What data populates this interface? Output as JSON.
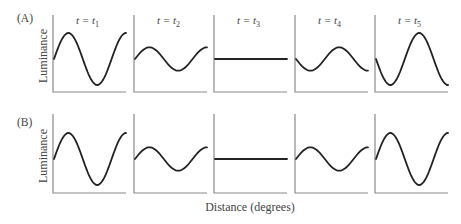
{
  "figure": {
    "rows": [
      {
        "label": "(A)",
        "ylabel": "Luminance"
      },
      {
        "label": "(B)",
        "ylabel": "Luminance"
      }
    ],
    "time_labels": [
      {
        "t": "t = ",
        "sub": "1"
      },
      {
        "t": "t = ",
        "sub": "2"
      },
      {
        "t": "t = ",
        "sub": "3"
      },
      {
        "t": "t = ",
        "sub": "4"
      },
      {
        "t": "t = ",
        "sub": "5"
      }
    ],
    "xlabel": "Distance (degrees)"
  },
  "chart_data": {
    "type": "line",
    "title": "",
    "xlabel": "Distance (degrees)",
    "ylabel": "Luminance",
    "panels_per_row": 5,
    "column_titles": [
      "t = t1",
      "t = t2",
      "t = t3",
      "t = t4",
      "t = t5"
    ],
    "rows": [
      {
        "name": "(A)",
        "description": "Counterphase flicker: sinusoidal luminance profile whose amplitude oscillates and reverses sign over time",
        "panels": [
          {
            "time": "t1",
            "relative_amplitude": 1.0,
            "phase": "0"
          },
          {
            "time": "t2",
            "relative_amplitude": 0.45,
            "phase": "0"
          },
          {
            "time": "t3",
            "relative_amplitude": 0.0,
            "phase": "flat"
          },
          {
            "time": "t4",
            "relative_amplitude": -0.45,
            "phase": "180"
          },
          {
            "time": "t5",
            "relative_amplitude": -1.0,
            "phase": "180"
          }
        ]
      },
      {
        "name": "(B)",
        "description": "Amplitude modulation without phase reversal: sinusoid shrinks to flat then grows again with same phase",
        "panels": [
          {
            "time": "t1",
            "relative_amplitude": 1.0,
            "phase": "0"
          },
          {
            "time": "t2",
            "relative_amplitude": 0.45,
            "phase": "0"
          },
          {
            "time": "t3",
            "relative_amplitude": 0.0,
            "phase": "flat"
          },
          {
            "time": "t4",
            "relative_amplitude": 0.45,
            "phase": "0"
          },
          {
            "time": "t5",
            "relative_amplitude": 1.0,
            "phase": "0"
          }
        ]
      }
    ],
    "grid": false,
    "legend": null
  }
}
